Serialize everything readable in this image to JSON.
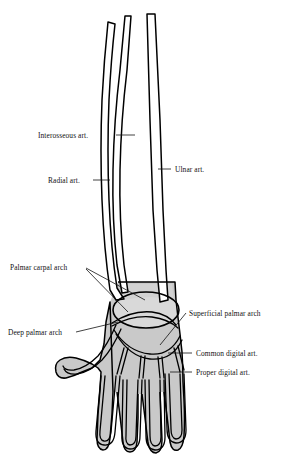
{
  "figure": {
    "type": "anatomical-line-drawing",
    "background_color": "#ffffff",
    "ink_color": "#000000",
    "hand_fill_color": "#c9c9c9",
    "carpal_fill_color": "#d9d9d9",
    "forearm_fill_color": "#ffffff"
  },
  "labels": [
    {
      "id": "interosseous",
      "text": "Interosseous art.",
      "text_x": 38,
      "text_y": 138,
      "anchor": "start",
      "leaders": [
        [
          116,
          135,
          135,
          135
        ]
      ]
    },
    {
      "id": "radial",
      "text": "Radial art.",
      "text_x": 48,
      "text_y": 183,
      "anchor": "start",
      "leaders": [
        [
          93,
          180,
          110,
          180
        ]
      ]
    },
    {
      "id": "ulnar",
      "text": "Ulnar art.",
      "text_x": 175,
      "text_y": 172,
      "anchor": "start",
      "leaders": [
        [
          158,
          169,
          171,
          169
        ]
      ]
    },
    {
      "id": "palmar-carpal",
      "text": "Palmar carpal arch",
      "text_x": 10,
      "text_y": 270,
      "anchor": "start",
      "leaders": [
        [
          86,
          268,
          145,
          300
        ],
        [
          86,
          269,
          128,
          312
        ]
      ]
    },
    {
      "id": "deep-palmar",
      "text": "Deep palmar arch",
      "text_x": 8,
      "text_y": 335,
      "anchor": "start",
      "leaders": [
        [
          76,
          332,
          118,
          322
        ]
      ]
    },
    {
      "id": "superficial-palmar",
      "text": "Superficial palmar arch",
      "text_x": 189,
      "text_y": 316,
      "anchor": "start",
      "leaders": [
        [
          186,
          313,
          160,
          345
        ]
      ]
    },
    {
      "id": "common-digital",
      "text": "Common digital art.",
      "text_x": 196,
      "text_y": 356,
      "anchor": "start",
      "leaders": [
        [
          192,
          353,
          168,
          353
        ]
      ]
    },
    {
      "id": "proper-digital",
      "text": "Proper digital art.",
      "text_x": 196,
      "text_y": 375,
      "anchor": "start",
      "leaders": [
        [
          192,
          372,
          170,
          372
        ]
      ]
    }
  ]
}
